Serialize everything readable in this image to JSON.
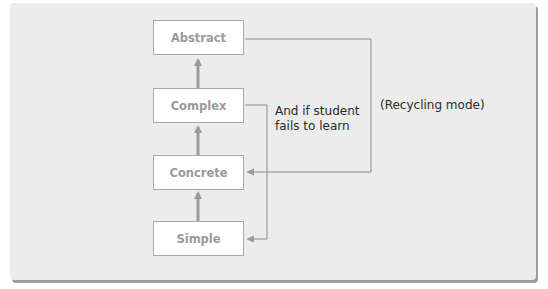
{
  "diagram": {
    "boxes": [
      {
        "id": "abstract",
        "label": "Abstract"
      },
      {
        "id": "complex",
        "label": "Complex"
      },
      {
        "id": "concrete",
        "label": "Concrete"
      },
      {
        "id": "simple",
        "label": "Simple"
      }
    ],
    "annotations": {
      "fail_line1": "And if student",
      "fail_line2": "fails to learn",
      "recycling": "(Recycling mode)"
    },
    "colors": {
      "panel": "#ececec",
      "box_border": "#a8a8a8",
      "box_text": "#9a9a9a",
      "thick_arrow": "#9a9a9a",
      "thin_line": "#8a8a8a"
    }
  }
}
